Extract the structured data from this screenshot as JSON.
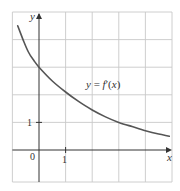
{
  "chart_data": {
    "type": "line",
    "title": "",
    "xlabel": "x",
    "ylabel": "y",
    "xlim": [
      -1,
      5
    ],
    "ylim": [
      -1.2,
      5
    ],
    "grid": true,
    "grid_step": 1,
    "legend": null,
    "x_tick_labels": [
      {
        "value": 0,
        "label": "0"
      },
      {
        "value": 1,
        "label": "1"
      }
    ],
    "y_tick_labels": [
      {
        "value": 1,
        "label": "1"
      }
    ],
    "series": [
      {
        "name": "y = f′(x)",
        "color": "#555555",
        "x": [
          -0.8,
          -0.6,
          -0.4,
          -0.2,
          0,
          0.5,
          1,
          1.5,
          2,
          2.5,
          3,
          3.5,
          4,
          4.5,
          4.9
        ],
        "y": [
          4.5,
          4.0,
          3.55,
          3.25,
          3.0,
          2.5,
          2.1,
          1.75,
          1.45,
          1.2,
          1.0,
          0.85,
          0.7,
          0.58,
          0.5
        ]
      }
    ],
    "annotations": [
      {
        "text": "y = f′(x)",
        "x": 2.95,
        "y": 2.45
      }
    ]
  },
  "labels": {
    "y_axis": "y",
    "x_axis": "x",
    "origin": "0",
    "x_one": "1",
    "y_one": "1",
    "curve_label": "y = f′(x)"
  },
  "colors": {
    "grid": "#c8c8c8",
    "axis": "#333333",
    "curve": "#555555"
  }
}
